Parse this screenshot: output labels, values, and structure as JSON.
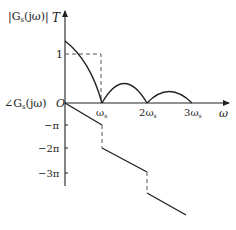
{
  "diagram": {
    "magnitude_axis_label": {
      "prefix": "|G",
      "sub": "s",
      "suffix": "(jω)|"
    },
    "magnitude_axis_value": "T",
    "phase_axis_label": {
      "prefix": "∠G",
      "sub": "s",
      "suffix": "(jω)"
    },
    "origin_label": "O",
    "x_axis_label": "ω",
    "magnitude_tick": "1",
    "x_ticks": [
      {
        "label_num": "",
        "label": "ω",
        "sub": "s"
      },
      {
        "label_num": "2",
        "label": "ω",
        "sub": "s"
      },
      {
        "label_num": "3",
        "label": "ω",
        "sub": "s"
      }
    ],
    "phase_ticks": [
      "−π",
      "−2π",
      "−3π"
    ],
    "colors": {
      "line": "#222222",
      "dashed": "#555555"
    }
  }
}
